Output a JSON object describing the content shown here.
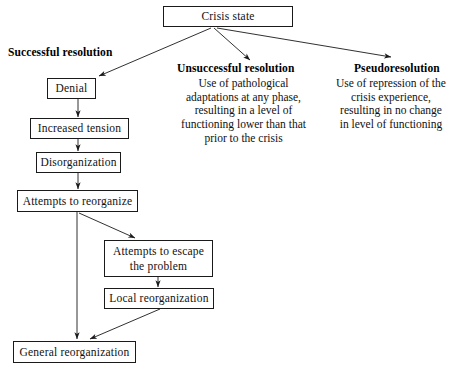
{
  "diagram": {
    "background_color": "#ffffff",
    "line_color": "#1a1a1a",
    "text_color": "#111111"
  },
  "root": {
    "label": "Crisis state"
  },
  "branches": {
    "successful": {
      "heading": "Successful resolution",
      "nodes": [
        {
          "label": "Denial"
        },
        {
          "label": "Increased tension"
        },
        {
          "label": "Disorganization"
        },
        {
          "label": "Attempts to reorganize"
        },
        {
          "label": "Attempts to escape the problem"
        },
        {
          "label": "Local reorganization"
        },
        {
          "label": "General reorganization"
        }
      ]
    },
    "unsuccessful": {
      "heading": "Unsuccessful resolution",
      "description": "Use of pathological adaptations at any phase, resulting in a level of functioning lower than that prior to the crisis"
    },
    "pseudoresolution": {
      "heading": "Pseudoresolution",
      "description": "Use of repression of the crisis experience, resulting in no change in level of functioning"
    }
  },
  "connectors": [
    {
      "name": "crisis-to-denial",
      "from": "Crisis state",
      "to": "Denial"
    },
    {
      "name": "crisis-to-unsuccessful",
      "from": "Crisis state",
      "to": "Unsuccessful resolution"
    },
    {
      "name": "crisis-to-pseudoresolution",
      "from": "Crisis state",
      "to": "Pseudoresolution"
    },
    {
      "name": "denial-to-increased-tension",
      "from": "Denial",
      "to": "Increased tension"
    },
    {
      "name": "increased-tension-to-disorganization",
      "from": "Increased tension",
      "to": "Disorganization"
    },
    {
      "name": "disorganization-to-attempts-reorganize",
      "from": "Disorganization",
      "to": "Attempts to reorganize"
    },
    {
      "name": "attempts-reorganize-to-general",
      "from": "Attempts to reorganize",
      "to": "General reorganization"
    },
    {
      "name": "attempts-reorganize-to-escape",
      "from": "Attempts to reorganize",
      "to": "Attempts to escape the problem"
    },
    {
      "name": "escape-to-local",
      "from": "Attempts to escape the problem",
      "to": "Local reorganization"
    },
    {
      "name": "local-to-general",
      "from": "Local reorganization",
      "to": "General reorganization"
    }
  ]
}
